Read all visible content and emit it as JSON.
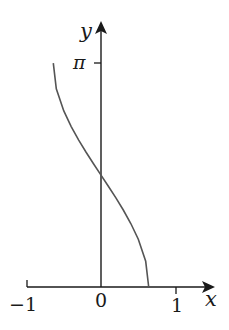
{
  "chart_data": {
    "type": "line",
    "title": "",
    "xlabel": "x",
    "ylabel": "y",
    "x_ticks": [
      "−1",
      "0",
      "1"
    ],
    "x_tick_values": [
      -1,
      0,
      1
    ],
    "y_ticks": [
      "π"
    ],
    "y_tick_values": [
      3.14159
    ],
    "xlim": [
      -1,
      1.2
    ],
    "ylim": [
      0,
      3.7
    ],
    "grid": false,
    "legend": null,
    "series": [
      {
        "name": "curve",
        "description": "decreasing curve from (-0.64, π) through (0, π/2) to (0.64, 0)",
        "x": [
          -0.64,
          -0.6,
          -0.5,
          -0.4,
          -0.3,
          -0.2,
          -0.1,
          0,
          0.1,
          0.2,
          0.3,
          0.4,
          0.5,
          0.6,
          0.64
        ],
        "y": [
          3.14,
          2.78,
          2.47,
          2.25,
          2.06,
          1.89,
          1.73,
          1.57,
          1.41,
          1.25,
          1.08,
          0.89,
          0.67,
          0.36,
          0.0
        ]
      }
    ],
    "colors": {
      "axis": "#1a1a1a",
      "curve": "#555555"
    }
  },
  "labels": {
    "x_axis": "x",
    "y_axis": "y",
    "x_tick_neg1": "−1",
    "x_tick_0": "0",
    "x_tick_1": "1",
    "y_tick_pi": "π"
  }
}
